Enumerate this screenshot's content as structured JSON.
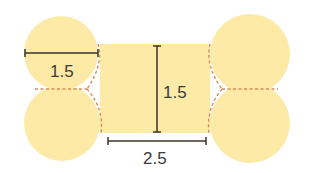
{
  "diagram": {
    "colors": {
      "fill": "#FCEAA6",
      "dash": "#D98A55",
      "dimension_line": "#3b3326",
      "label": "#3a3a3a"
    },
    "shapes": {
      "rectangle": {
        "x": 100,
        "y": 44,
        "width": 110,
        "height": 89
      },
      "circles": [
        {
          "name": "top-left",
          "cx": 61,
          "cy": 53,
          "r": 37
        },
        {
          "name": "bottom-left",
          "cx": 62,
          "cy": 123,
          "r": 38
        },
        {
          "name": "top-right",
          "cx": 250,
          "cy": 54,
          "r": 40
        },
        {
          "name": "bottom-right",
          "cx": 250,
          "cy": 123,
          "r": 40
        }
      ]
    },
    "dimensions": {
      "circle_diameter": {
        "label": "1.5",
        "x1": 25,
        "x2": 98,
        "y": 53,
        "label_x": 50,
        "label_y": 77
      },
      "rect_height": {
        "label": "1.5",
        "x": 157,
        "y1": 46,
        "y2": 132,
        "label_x": 163,
        "label_y": 98
      },
      "rect_width": {
        "label": "2.5",
        "x1": 108,
        "x2": 206,
        "y": 141,
        "label_x": 143,
        "label_y": 164
      }
    }
  }
}
